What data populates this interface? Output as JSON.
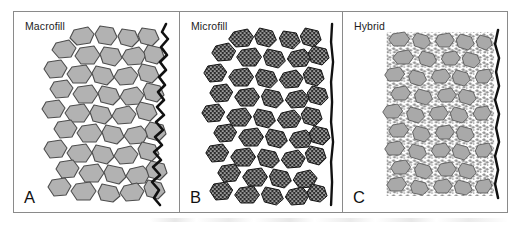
{
  "figure": {
    "type": "three-panel-diagram",
    "background_color": "#ffffff",
    "frame_color": "#8a8a8a",
    "panels": [
      {
        "id": "a",
        "letter": "A",
        "title": "Macrofill",
        "particle_style": "large irregular solid grey polygons",
        "particle_fill": "#b0b0b0",
        "particle_stroke": "#4a4a4a",
        "surface_line_color": "#111111",
        "surface_profile": "very rough, deeply jagged"
      },
      {
        "id": "b",
        "letter": "B",
        "title": "Microfill",
        "particle_style": "small dark stippled clusters",
        "particle_fill": "#3a3a3a",
        "particle_stroke": "#151515",
        "surface_line_color": "#111111",
        "surface_profile": "nearly straight, smooth"
      },
      {
        "id": "c",
        "letter": "C",
        "title": "Hybrid",
        "particle_style": "medium grey particles densely packed with fine filler",
        "particle_fill": "#a8a8a8",
        "particle_stroke": "#5a5a5a",
        "surface_line_color": "#111111",
        "surface_profile": "slightly wavy, intermediate"
      }
    ]
  }
}
